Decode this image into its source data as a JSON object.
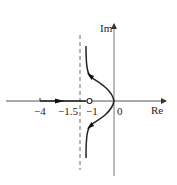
{
  "diagram": {
    "type": "root-locus",
    "axes": {
      "real_label": "Re",
      "imag_label": "Im"
    },
    "tick_labels": {
      "t_neg4": "−4",
      "t_neg1_5": "−1.5",
      "t_neg1": "−1",
      "t_0": "0"
    },
    "asymptote": {
      "value": -1.5,
      "style": "dashed"
    },
    "zero": {
      "value": -1,
      "marker": "open-circle"
    },
    "pole": {
      "value": 0
    },
    "branches": [
      "real-axis segment from -4 toward -1 (arrow pointing right)",
      "upper branch from 0 curving up-left toward asymptote Re=-1.5",
      "lower branch from 0 curving down-left toward asymptote Re=-1.5"
    ],
    "colors": {
      "stroke": "#222222",
      "axis": "#555555"
    }
  }
}
